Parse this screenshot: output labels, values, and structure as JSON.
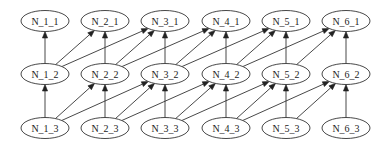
{
  "diagram": {
    "type": "directed-graph",
    "layout": {
      "columns_x": [
        45,
        105,
        165,
        226,
        286,
        346
      ],
      "rows_y": [
        21,
        74,
        128
      ],
      "node_rx": 24,
      "node_ry": 10.5
    },
    "colors": {
      "stroke": "#333333",
      "fill": "#ffffff",
      "text": "#222222",
      "background": "#ffffff"
    },
    "nodes": [
      {
        "id": "N_1_1",
        "label": "N_1_1",
        "col": 0,
        "row": 0
      },
      {
        "id": "N_2_1",
        "label": "N_2_1",
        "col": 1,
        "row": 0
      },
      {
        "id": "N_3_1",
        "label": "N_3_1",
        "col": 2,
        "row": 0
      },
      {
        "id": "N_4_1",
        "label": "N_4_1",
        "col": 3,
        "row": 0
      },
      {
        "id": "N_5_1",
        "label": "N_5_1",
        "col": 4,
        "row": 0
      },
      {
        "id": "N_6_1",
        "label": "N_6_1",
        "col": 5,
        "row": 0
      },
      {
        "id": "N_1_2",
        "label": "N_1_2",
        "col": 0,
        "row": 1
      },
      {
        "id": "N_2_2",
        "label": "N_2_2",
        "col": 1,
        "row": 1
      },
      {
        "id": "N_3_2",
        "label": "N_3_2",
        "col": 2,
        "row": 1
      },
      {
        "id": "N_4_2",
        "label": "N_4_2",
        "col": 3,
        "row": 1
      },
      {
        "id": "N_5_2",
        "label": "N_5_2",
        "col": 4,
        "row": 1
      },
      {
        "id": "N_6_2",
        "label": "N_6_2",
        "col": 5,
        "row": 1
      },
      {
        "id": "N_1_3",
        "label": "N_1_3",
        "col": 0,
        "row": 2
      },
      {
        "id": "N_2_3",
        "label": "N_2_3",
        "col": 1,
        "row": 2
      },
      {
        "id": "N_3_3",
        "label": "N_3_3",
        "col": 2,
        "row": 2
      },
      {
        "id": "N_4_3",
        "label": "N_4_3",
        "col": 3,
        "row": 2
      },
      {
        "id": "N_5_3",
        "label": "N_5_3",
        "col": 4,
        "row": 2
      },
      {
        "id": "N_6_3",
        "label": "N_6_3",
        "col": 5,
        "row": 2
      }
    ],
    "edges": [
      {
        "from": "N_1_2",
        "to": "N_1_1"
      },
      {
        "from": "N_1_2",
        "to": "N_2_1"
      },
      {
        "from": "N_1_2",
        "to": "N_3_1"
      },
      {
        "from": "N_2_2",
        "to": "N_2_1"
      },
      {
        "from": "N_2_2",
        "to": "N_3_1"
      },
      {
        "from": "N_2_2",
        "to": "N_4_1"
      },
      {
        "from": "N_3_2",
        "to": "N_3_1"
      },
      {
        "from": "N_3_2",
        "to": "N_4_1"
      },
      {
        "from": "N_3_2",
        "to": "N_5_1"
      },
      {
        "from": "N_4_2",
        "to": "N_4_1"
      },
      {
        "from": "N_4_2",
        "to": "N_5_1"
      },
      {
        "from": "N_4_2",
        "to": "N_6_1"
      },
      {
        "from": "N_5_2",
        "to": "N_5_1"
      },
      {
        "from": "N_5_2",
        "to": "N_6_1"
      },
      {
        "from": "N_6_2",
        "to": "N_6_1"
      },
      {
        "from": "N_1_3",
        "to": "N_1_2"
      },
      {
        "from": "N_1_3",
        "to": "N_2_2"
      },
      {
        "from": "N_1_3",
        "to": "N_3_2"
      },
      {
        "from": "N_2_3",
        "to": "N_2_2"
      },
      {
        "from": "N_2_3",
        "to": "N_3_2"
      },
      {
        "from": "N_2_3",
        "to": "N_4_2"
      },
      {
        "from": "N_3_3",
        "to": "N_3_2"
      },
      {
        "from": "N_3_3",
        "to": "N_4_2"
      },
      {
        "from": "N_3_3",
        "to": "N_5_2"
      },
      {
        "from": "N_4_3",
        "to": "N_4_2"
      },
      {
        "from": "N_4_3",
        "to": "N_5_2"
      },
      {
        "from": "N_4_3",
        "to": "N_6_2"
      },
      {
        "from": "N_5_3",
        "to": "N_5_2"
      },
      {
        "from": "N_5_3",
        "to": "N_6_2"
      },
      {
        "from": "N_6_3",
        "to": "N_6_2"
      }
    ]
  }
}
